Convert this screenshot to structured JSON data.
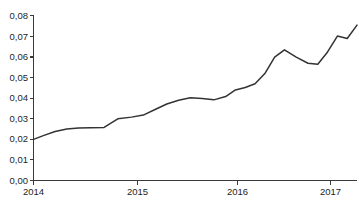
{
  "chart_data": {
    "type": "line",
    "title": "",
    "subtitle": "",
    "xlabel": "",
    "ylabel": "",
    "grid": false,
    "legend": false,
    "legend_position": "none",
    "xlim": [
      2014.0,
      2017.3
    ],
    "ylim": [
      0.0,
      0.08
    ],
    "x_tick_labels": [
      "2014",
      "2015",
      "2016",
      "2017"
    ],
    "x_tick_values": [
      2014,
      2015,
      2016,
      2017
    ],
    "y_tick_labels": [
      "0,00",
      "0,01",
      "0,02",
      "0,03",
      "0,04",
      "0,05",
      "0,06",
      "0,07",
      "0,08"
    ],
    "y_tick_values": [
      0.0,
      0.01,
      0.02,
      0.03,
      0.04,
      0.05,
      0.06,
      0.07,
      0.08
    ],
    "series": [
      {
        "name": "series-1",
        "color": "#333333",
        "x": [
          2014.0,
          2014.1,
          2014.22,
          2014.34,
          2014.46,
          2014.58,
          2014.72,
          2014.86,
          2015.0,
          2015.12,
          2015.24,
          2015.36,
          2015.48,
          2015.6,
          2015.72,
          2015.84,
          2015.96,
          2016.06,
          2016.16,
          2016.26,
          2016.36,
          2016.46,
          2016.56,
          2016.68,
          2016.8,
          2016.9,
          2017.0,
          2017.1,
          2017.2,
          2017.3
        ],
        "y": [
          0.02,
          0.0218,
          0.0238,
          0.025,
          0.0255,
          0.0256,
          0.0258,
          0.03,
          0.0308,
          0.0318,
          0.0345,
          0.0372,
          0.039,
          0.0402,
          0.0398,
          0.0392,
          0.0408,
          0.044,
          0.0452,
          0.047,
          0.052,
          0.06,
          0.0635,
          0.06,
          0.057,
          0.0565,
          0.0625,
          0.0702,
          0.069,
          0.0755
        ]
      }
    ]
  },
  "caption": {
    "text": "",
    "clipped": true
  }
}
